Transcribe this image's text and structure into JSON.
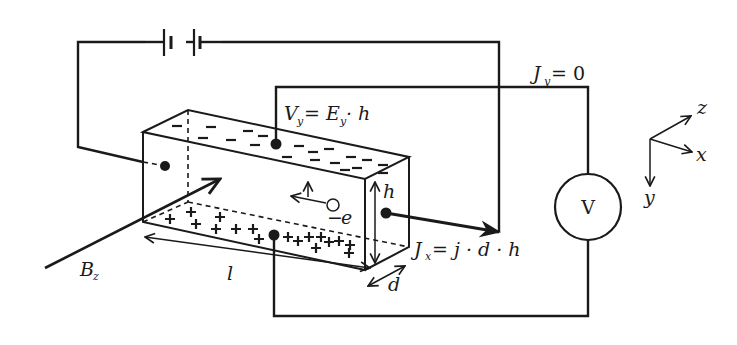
{
  "figure": {
    "labels": {
      "vy_main": "V",
      "vy_sub": "y",
      "vy_eq": "= E",
      "vy_eq_sub": "y",
      "vy_tail": "· h",
      "jy_main": "J",
      "jy_sub": "y",
      "jy_tail": "= 0",
      "jx_main": "J",
      "jx_sub": "x",
      "jx_tail": "= j · d · h",
      "bz_main": "B",
      "bz_sub": "z",
      "length": "l",
      "height": "h",
      "depth": "d",
      "electron": "e",
      "electron_sign": "−",
      "voltmeter": "V"
    },
    "axes": {
      "x": "x",
      "y": "y",
      "z": "z"
    },
    "top_charges": [
      "−",
      "−",
      "−",
      "−",
      "−",
      "−",
      "−",
      "−",
      "−",
      "−",
      "−",
      "−",
      "−",
      "−",
      "−",
      "−",
      "−",
      "−",
      "−"
    ],
    "bottom_charges": [
      "+",
      "+",
      "+",
      "+",
      "+",
      "+",
      "+",
      "+",
      "+",
      "+",
      "+",
      "+",
      "+",
      "+",
      "+",
      "+",
      "+",
      "+",
      "+"
    ],
    "components": [
      "battery",
      "voltmeter",
      "sample-bar"
    ],
    "colors": {
      "ink": "#1a1a1a",
      "background": "#ffffff"
    }
  }
}
